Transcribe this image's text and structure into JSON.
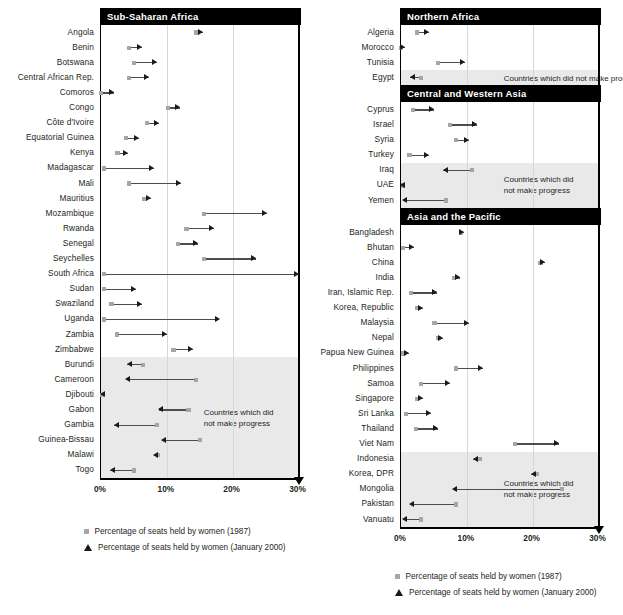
{
  "chart_data": {
    "type": "bar",
    "xlabel": "",
    "ylabel": "",
    "xlim": [
      0,
      30
    ],
    "tick_labels": [
      "0%",
      "10%",
      "20%",
      "30%"
    ],
    "tick_values": [
      0,
      10,
      20,
      30
    ],
    "grid": true,
    "legend": [
      {
        "marker": "square",
        "label": "Percentage of seats held by women (1987)"
      },
      {
        "marker": "triangle",
        "label": "Percentage of seats held by women (January 2000)"
      }
    ],
    "shaded_note": "Countries which did not make progress",
    "series_names": [
      "1987",
      "January 2000"
    ],
    "panels": [
      {
        "id": "left",
        "sections": [
          {
            "title": "Sub-Saharan Africa",
            "rows": [
              {
                "country": "Angola",
                "v1987": 14.5,
                "v2000": 15.5,
                "progress": true
              },
              {
                "country": "Benin",
                "v1987": 4.2,
                "v2000": 6.2,
                "progress": true
              },
              {
                "country": "Botswana",
                "v1987": 5.0,
                "v2000": 8.5,
                "progress": true
              },
              {
                "country": "Central African Rep.",
                "v1987": 4.3,
                "v2000": 7.3,
                "progress": true
              },
              {
                "country": "Comoros",
                "v1987": 0.0,
                "v2000": 2.0,
                "progress": true
              },
              {
                "country": "Congo",
                "v1987": 10.2,
                "v2000": 12.0,
                "progress": true
              },
              {
                "country": "Côte d'Ivoire",
                "v1987": 7.0,
                "v2000": 8.8,
                "progress": true
              },
              {
                "country": "Equatorial Guinea",
                "v1987": 3.8,
                "v2000": 5.8,
                "progress": true
              },
              {
                "country": "Kenya",
                "v1987": 2.5,
                "v2000": 4.1,
                "progress": true
              },
              {
                "country": "Madagascar",
                "v1987": 0.4,
                "v2000": 8.0,
                "progress": true
              },
              {
                "country": "Mali",
                "v1987": 4.2,
                "v2000": 12.2,
                "progress": true
              },
              {
                "country": "Mauritius",
                "v1987": 6.6,
                "v2000": 7.6,
                "progress": true
              },
              {
                "country": "Mozambique",
                "v1987": 15.7,
                "v2000": 25.2,
                "progress": true
              },
              {
                "country": "Rwanda",
                "v1987": 13.0,
                "v2000": 17.1,
                "progress": true
              },
              {
                "country": "Senegal",
                "v1987": 11.7,
                "v2000": 14.8,
                "progress": true
              },
              {
                "country": "Seychelles",
                "v1987": 15.7,
                "v2000": 23.5,
                "progress": true
              },
              {
                "country": "South Africa",
                "v1987": 0.5,
                "v2000": 30.0,
                "progress": true
              },
              {
                "country": "Sudan",
                "v1987": 0.5,
                "v2000": 5.3,
                "progress": true
              },
              {
                "country": "Swaziland",
                "v1987": 1.6,
                "v2000": 6.3,
                "progress": true
              },
              {
                "country": "Uganda",
                "v1987": 0.5,
                "v2000": 18.0,
                "progress": true
              },
              {
                "country": "Zambia",
                "v1987": 2.4,
                "v2000": 10.1,
                "progress": true
              },
              {
                "country": "Zimbabwe",
                "v1987": 11.0,
                "v2000": 14.0,
                "progress": true
              },
              {
                "country": "Burundi",
                "v1987": 6.4,
                "v2000": 4.0,
                "progress": false
              },
              {
                "country": "Cameroon",
                "v1987": 14.4,
                "v2000": 3.8,
                "progress": false
              },
              {
                "country": "Djibouti",
                "v1987": 0.2,
                "v2000": 0.0,
                "progress": false
              },
              {
                "country": "Gabon",
                "v1987": 13.3,
                "v2000": 8.8,
                "progress": false
              },
              {
                "country": "Gambia",
                "v1987": 8.5,
                "v2000": 2.0,
                "progress": false
              },
              {
                "country": "Guinea-Bissau",
                "v1987": 15.0,
                "v2000": 9.2,
                "progress": false
              },
              {
                "country": "Malawi",
                "v1987": 8.7,
                "v2000": 8.0,
                "progress": false
              },
              {
                "country": "Togo",
                "v1987": 5.0,
                "v2000": 1.4,
                "progress": false
              }
            ]
          }
        ]
      },
      {
        "id": "right",
        "sections": [
          {
            "title": "Northern Africa",
            "rows": [
              {
                "country": "Algeria",
                "v1987": 2.4,
                "v2000": 4.2,
                "progress": true
              },
              {
                "country": "Morocco",
                "v1987": 0.0,
                "v2000": 0.6,
                "progress": true
              },
              {
                "country": "Tunisia",
                "v1987": 5.6,
                "v2000": 9.7,
                "progress": true
              },
              {
                "country": "Egypt",
                "v1987": 3.0,
                "v2000": 1.4,
                "progress": false
              }
            ]
          },
          {
            "title": "Central and Western Asia",
            "rows": [
              {
                "country": "Cyprus",
                "v1987": 1.8,
                "v2000": 5.0,
                "progress": true
              },
              {
                "country": "Israel",
                "v1987": 7.5,
                "v2000": 11.5,
                "progress": true
              },
              {
                "country": "Syria",
                "v1987": 8.4,
                "v2000": 10.4,
                "progress": true
              },
              {
                "country": "Turkey",
                "v1987": 1.3,
                "v2000": 4.2,
                "progress": true
              },
              {
                "country": "Iraq",
                "v1987": 10.8,
                "v2000": 6.4,
                "progress": false
              },
              {
                "country": "UAE",
                "v1987": 0.3,
                "v2000": 0.0,
                "progress": false
              },
              {
                "country": "Yemen",
                "v1987": 6.8,
                "v2000": 0.3,
                "progress": false
              }
            ]
          },
          {
            "title": "Asia and the Pacific",
            "rows": [
              {
                "country": "Bangladesh",
                "v1987": 9.1,
                "v2000": 9.5,
                "progress": true
              },
              {
                "country": "Bhutan",
                "v1987": 0.3,
                "v2000": 2.0,
                "progress": true
              },
              {
                "country": "China",
                "v1987": 21.2,
                "v2000": 21.8,
                "progress": true
              },
              {
                "country": "India",
                "v1987": 8.1,
                "v2000": 9.0,
                "progress": true
              },
              {
                "country": "Iran, Islamic Rep.",
                "v1987": 1.5,
                "v2000": 5.5,
                "progress": true
              },
              {
                "country": "Korea, Republic",
                "v1987": 2.4,
                "v2000": 3.3,
                "progress": true
              },
              {
                "country": "Malaysia",
                "v1987": 5.1,
                "v2000": 10.4,
                "progress": true
              },
              {
                "country": "Nepal",
                "v1987": 5.7,
                "v2000": 6.4,
                "progress": true
              },
              {
                "country": "Papua New Guinea",
                "v1987": 0.3,
                "v2000": 1.2,
                "progress": true
              },
              {
                "country": "Philippines",
                "v1987": 8.4,
                "v2000": 12.4,
                "progress": true
              },
              {
                "country": "Samoa",
                "v1987": 3.0,
                "v2000": 7.4,
                "progress": true
              },
              {
                "country": "Singapore",
                "v1987": 2.4,
                "v2000": 3.4,
                "progress": true
              },
              {
                "country": "Sri Lanka",
                "v1987": 0.8,
                "v2000": 4.5,
                "progress": true
              },
              {
                "country": "Thailand",
                "v1987": 2.3,
                "v2000": 5.6,
                "progress": true
              },
              {
                "country": "Viet Nam",
                "v1987": 17.3,
                "v2000": 24.0,
                "progress": true
              },
              {
                "country": "Indonesia",
                "v1987": 12.0,
                "v2000": 11.0,
                "progress": false
              },
              {
                "country": "Korea, DPR",
                "v1987": 20.6,
                "v2000": 19.8,
                "progress": false
              },
              {
                "country": "Mongolia",
                "v1987": 24.5,
                "v2000": 7.9,
                "progress": false
              },
              {
                "country": "Pakistan",
                "v1987": 8.4,
                "v2000": 1.3,
                "progress": false
              },
              {
                "country": "Vanuatu",
                "v1987": 3.1,
                "v2000": 0.3,
                "progress": false
              }
            ]
          }
        ]
      }
    ]
  },
  "colors": {
    "header_bg": "#000000",
    "header_text": "#ffffff",
    "shade": "#e9e9e9",
    "grid": "#cfd8e4",
    "marker_1987": "#a6a6a6",
    "marker_2000": "#1a1a1a",
    "text": "#231f20"
  }
}
